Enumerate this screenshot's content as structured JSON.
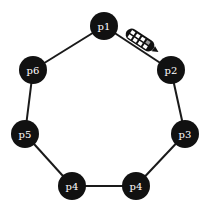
{
  "diagram": {
    "type": "ring-network",
    "colors": {
      "node": "#111111",
      "edge": "#1a1a1a",
      "label": "#ffffff",
      "background": "#ffffff"
    },
    "nodes": [
      {
        "id": "n1",
        "label": "p1",
        "x": 104,
        "y": 26
      },
      {
        "id": "n2",
        "label": "p2",
        "x": 171,
        "y": 70
      },
      {
        "id": "n3",
        "label": "p3",
        "x": 185,
        "y": 134
      },
      {
        "id": "n4",
        "label": "p4",
        "x": 136,
        "y": 186
      },
      {
        "id": "n5",
        "label": "p4",
        "x": 72,
        "y": 186
      },
      {
        "id": "n6",
        "label": "p5",
        "x": 25,
        "y": 134
      },
      {
        "id": "n7",
        "label": "p6",
        "x": 33,
        "y": 70
      }
    ],
    "edges": [
      [
        "n1",
        "n2"
      ],
      [
        "n2",
        "n3"
      ],
      [
        "n3",
        "n4"
      ],
      [
        "n4",
        "n5"
      ],
      [
        "n5",
        "n6"
      ],
      [
        "n6",
        "n7"
      ],
      [
        "n7",
        "n1"
      ]
    ],
    "token": {
      "icon": "token-message-icon",
      "on_edge": [
        "n1",
        "n2"
      ],
      "direction": "p1 to p2"
    }
  }
}
